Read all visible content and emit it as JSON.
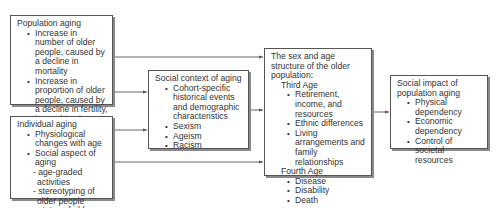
{
  "boxes": {
    "population_aging": {
      "title": "Population aging",
      "items": [
        "Increase in number of older people, caused by a decline in mortality",
        "Increase in proportion of older people, caused by a decline in fertility, in combination with migration (especially urbanization)"
      ]
    },
    "individual_aging": {
      "title": "Individual aging",
      "items": [
        "Physiological changes with age",
        "Social aspect of aging"
      ],
      "sub_items": [
        "- age-graded activities",
        "- stereotyping of older people",
        "- status of older people"
      ]
    },
    "social_context": {
      "title": "Social context of aging",
      "items": [
        "Cohort-specific historical events and demographic characteristics",
        "Sexism",
        "Ageism",
        "Racism"
      ]
    },
    "structure": {
      "title": "The sex and age structure of the older population:",
      "third_age": {
        "label": "Third Age",
        "items": [
          "Retirement, income, and resources",
          "Ethnic differences",
          "Living arrangements and family relationships"
        ]
      },
      "fourth_age": {
        "label": "Fourth Age",
        "items": [
          "Disease",
          "Disability",
          "Death"
        ]
      }
    },
    "social_impact": {
      "title": "Social impact of population aging",
      "items": [
        "Physical dependency",
        "Economic dependency",
        "Control of societal resources"
      ]
    }
  },
  "colors": {
    "line": "#555555",
    "shadow": "#8a8a8a",
    "text": "#333333"
  }
}
